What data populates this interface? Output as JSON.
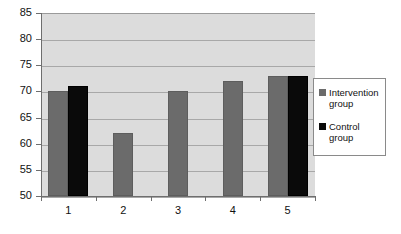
{
  "chart_data": {
    "type": "bar",
    "title": "",
    "subtitle": "",
    "xlabel": "",
    "ylabel": "",
    "categories": [
      "1",
      "2",
      "3",
      "4",
      "5"
    ],
    "series": [
      {
        "name": "Intervention group",
        "color": "#6b6b6b",
        "values": [
          70,
          62,
          70,
          72,
          73
        ]
      },
      {
        "name": "Control group",
        "color": "#0a0a0a",
        "values": [
          71,
          null,
          null,
          null,
          73
        ]
      }
    ],
    "ylim": [
      50,
      85
    ],
    "yticks": [
      50,
      55,
      60,
      65,
      70,
      75,
      80,
      85
    ],
    "ytick_labels": [
      "50",
      "55",
      "60",
      "65",
      "70",
      "75",
      "80",
      "85"
    ],
    "xtick_labels": [
      "1",
      "2",
      "3",
      "4",
      "5"
    ],
    "grid": true,
    "grid_axis": "y",
    "legend_position": "right",
    "plot_background": "#dcdcdc",
    "figure_background": "#ffffff"
  },
  "legend": {
    "entries": [
      {
        "label_line1": "Intervention",
        "label_line2": "group"
      },
      {
        "label_line1": "Control",
        "label_line2": "group"
      }
    ]
  }
}
